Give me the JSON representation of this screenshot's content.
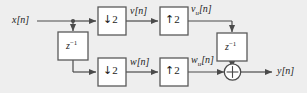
{
  "figure": {
    "type": "block-diagram",
    "domain": "signal-processing",
    "background_color": "#eeeeee",
    "line_color": "#4a4a4a",
    "block_border_color": "#5a5a5a",
    "block_fill_color": "#ffffff",
    "text_color": "#1c1c1c"
  },
  "signals": {
    "input": "x[n]",
    "upper_branch_mid": "v[n]",
    "upper_branch_upsampled": "v",
    "upper_branch_upsampled_sub": "u",
    "upper_branch_upsampled_tail": "[n]",
    "lower_branch_mid": "w[n]",
    "lower_branch_upsampled": "w",
    "lower_branch_upsampled_sub": "u",
    "lower_branch_upsampled_tail": "[n]",
    "output": "y[n]"
  },
  "blocks": [
    {
      "id": "downsampler-upper",
      "label": "2",
      "arrow": "↓",
      "full_label": "↓2",
      "name": "downsampler",
      "factor": 2,
      "branch": "upper"
    },
    {
      "id": "upsampler-upper",
      "label": "2",
      "arrow": "↑",
      "full_label": "↑2",
      "name": "upsampler",
      "factor": 2,
      "branch": "upper"
    },
    {
      "id": "delay-left",
      "label": "z",
      "exponent": "−1",
      "full_label": "z⁻¹",
      "name": "unit-delay",
      "branch": "input"
    },
    {
      "id": "delay-right",
      "label": "z",
      "exponent": "−1",
      "full_label": "z⁻¹",
      "name": "unit-delay",
      "branch": "upper"
    },
    {
      "id": "downsampler-lower",
      "label": "2",
      "arrow": "↓",
      "full_label": "↓2",
      "name": "downsampler",
      "factor": 2,
      "branch": "lower"
    },
    {
      "id": "upsampler-lower",
      "label": "2",
      "arrow": "↑",
      "full_label": "↑2",
      "name": "upsampler",
      "factor": 2,
      "branch": "lower"
    }
  ],
  "adder": {
    "symbol": "+",
    "name": "summing-junction"
  }
}
